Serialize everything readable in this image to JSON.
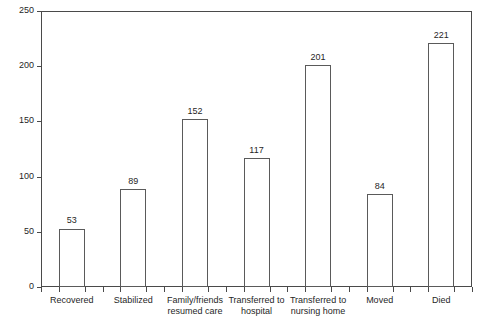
{
  "chart_data": {
    "type": "bar",
    "title": "",
    "xlabel": "",
    "ylabel": "Average number of days",
    "ylim": [
      0,
      250
    ],
    "yticks": [
      0,
      50,
      100,
      150,
      200,
      250
    ],
    "grid": false,
    "legend": "none",
    "bar_style": {
      "fill": "#ffffff",
      "edge": "#5a5a5a"
    },
    "categories": [
      "Recovered",
      "Stabilized",
      "Family/friends resumed care",
      "Transferred to hospital",
      "Transferred to nursing home",
      "Moved",
      "Died"
    ],
    "category_lines": [
      [
        "Recovered"
      ],
      [
        "Stabilized"
      ],
      [
        "Family/friends",
        "resumed care"
      ],
      [
        "Transferred to",
        "hospital"
      ],
      [
        "Transferred to",
        "nursing home"
      ],
      [
        "Moved"
      ],
      [
        "Died"
      ]
    ],
    "values": [
      53,
      89,
      152,
      117,
      201,
      84,
      221
    ],
    "value_labels": [
      "53",
      "89",
      "152",
      "117",
      "201",
      "84",
      "221"
    ]
  }
}
